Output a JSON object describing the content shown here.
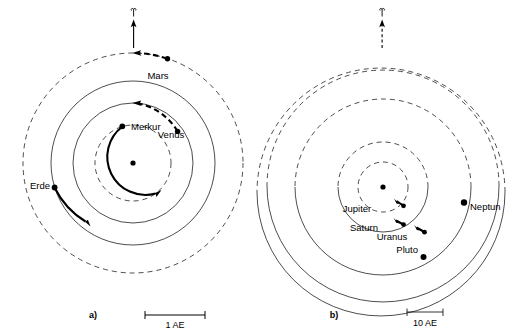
{
  "figure": {
    "background_color": "#ffffff",
    "line_color": "#000000",
    "width": 513,
    "height": 336
  },
  "panels": [
    {
      "id": "a",
      "label": "a)",
      "name": "inner-planets-panel",
      "sun_label": "",
      "direction_marker": {
        "symbol": "aries",
        "symbol_name": "vernal-equinox-aries-icon",
        "arrow_style": "solid"
      },
      "scale_bar": {
        "label": "1 AE",
        "value": 1,
        "unit": "AE",
        "style": "plain-endcaps"
      },
      "orbits": [
        {
          "name": "Merkur",
          "label": "Merkur",
          "radius_px": 38,
          "style": "dashed",
          "order": 1
        },
        {
          "name": "Venus",
          "label": "Venus",
          "radius_px": 60,
          "style": "dashed",
          "order": 2
        },
        {
          "name": "Erde",
          "label": "Erde",
          "radius_px": 82,
          "style": "solid",
          "order": 3
        },
        {
          "name": "Mars",
          "label": "Mars",
          "radius_px": 110,
          "style": "dashed",
          "order": 4
        }
      ],
      "planets": [
        {
          "name": "Merkur",
          "label": "Merkur",
          "arc_style": "solid",
          "arc_direction": "clockwise"
        },
        {
          "name": "Venus",
          "label": "Venus",
          "arc_style": "dashed",
          "arc_direction": "counterclockwise"
        },
        {
          "name": "Erde",
          "label": "Erde",
          "arc_style": "solid",
          "arc_direction": "clockwise"
        },
        {
          "name": "Mars",
          "label": "Mars",
          "arc_style": "dashed",
          "arc_direction": "counterclockwise"
        }
      ]
    },
    {
      "id": "b",
      "label": "b)",
      "name": "outer-planets-panel",
      "sun_label": "",
      "direction_marker": {
        "symbol": "aries",
        "symbol_name": "vernal-equinox-aries-icon",
        "arrow_style": "dashed"
      },
      "scale_bar": {
        "label": "10 AE",
        "value": 10,
        "unit": "AE",
        "style": "ticked-endcaps"
      },
      "orbits": [
        {
          "name": "Jupiter",
          "label": "Jupiter",
          "radius_px": 25,
          "style": "dashed",
          "order": 1
        },
        {
          "name": "Saturn",
          "label": "Saturn",
          "radius_px": 45,
          "style": "dashed",
          "order": 2
        },
        {
          "name": "Uranus",
          "label": "Uranus",
          "radius_px": 88,
          "style": "dashed",
          "order": 3
        },
        {
          "name": "Neptun",
          "label": "Neptun",
          "radius_px": 120,
          "style": "dashed",
          "order": 4
        },
        {
          "name": "Pluto",
          "label": "Pluto",
          "radius_px": 128,
          "style": "dashed",
          "order": 5,
          "eccentric": true
        }
      ],
      "planets": [
        {
          "name": "Jupiter",
          "label": "Jupiter",
          "arc_style": "solid",
          "arc_direction": "clockwise"
        },
        {
          "name": "Saturn",
          "label": "Saturn",
          "arc_style": "solid",
          "arc_direction": "clockwise"
        },
        {
          "name": "Uranus",
          "label": "Uranus",
          "arc_style": "solid",
          "arc_direction": "clockwise"
        },
        {
          "name": "Neptun",
          "label": "Neptun",
          "arc_style": "solid",
          "arc_direction": "clockwise"
        },
        {
          "name": "Pluto",
          "label": "Pluto",
          "arc_style": "solid",
          "arc_direction": "clockwise"
        }
      ]
    }
  ],
  "labels": {
    "panel_a": "a)",
    "panel_b": "b)",
    "scale_a": "1 AE",
    "scale_b": "10 AE",
    "merkur": "Merkur",
    "venus": "Venus",
    "erde": "Erde",
    "mars": "Mars",
    "jupiter": "Jupiter",
    "saturn": "Saturn",
    "uranus": "Uranus",
    "neptun": "Neptun",
    "pluto": "Pluto"
  }
}
